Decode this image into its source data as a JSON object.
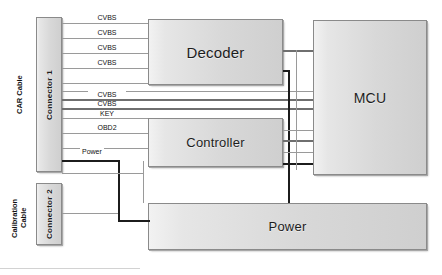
{
  "diagram": {
    "colors": {
      "block_fill_light": "#f2f2f2",
      "block_fill_dark": "#cfcfcf",
      "block_border": "#8a8a8a",
      "wire": "#9a9a9a",
      "bus": "#1c1c1c",
      "background": "#ffffff"
    },
    "cables": [
      {
        "id": "car-cable",
        "label": "CAR Cable"
      },
      {
        "id": "calibration-cable",
        "label": "Calibration\nCable"
      }
    ],
    "connectors": [
      {
        "id": "connector-1",
        "label": "Connector 1"
      },
      {
        "id": "connector-2",
        "label": "Connector 2"
      }
    ],
    "blocks": [
      {
        "id": "decoder",
        "label": "Decoder"
      },
      {
        "id": "mcu",
        "label": "MCU"
      },
      {
        "id": "controller",
        "label": "Controller"
      },
      {
        "id": "power",
        "label": "Power"
      }
    ],
    "signals": [
      {
        "id": "cvbs-1",
        "label": "CVBS",
        "from": "connector-1",
        "to": "decoder",
        "style": "thin"
      },
      {
        "id": "cvbs-2",
        "label": "CVBS",
        "from": "connector-1",
        "to": "decoder",
        "style": "thin"
      },
      {
        "id": "cvbs-3",
        "label": "CVBS",
        "from": "connector-1",
        "to": "decoder",
        "style": "thin"
      },
      {
        "id": "cvbs-4",
        "label": "CVBS",
        "from": "connector-1",
        "to": "decoder",
        "style": "thin"
      },
      {
        "id": "cvbs-5",
        "label": "CVBS",
        "from": "connector-1",
        "to": "mcu",
        "style": "thick"
      },
      {
        "id": "cvbs-6",
        "label": "CVBS",
        "from": "connector-1",
        "to": "mcu",
        "style": "thick"
      },
      {
        "id": "key",
        "label": "KEY",
        "from": "connector-1",
        "to": "controller",
        "style": "thin"
      },
      {
        "id": "obd2",
        "label": "OBD2",
        "from": "connector-1",
        "to": "controller",
        "style": "thin"
      },
      {
        "id": "power-in",
        "label": "Power",
        "from": "connector-1",
        "to": "power",
        "style": "bus"
      }
    ]
  }
}
